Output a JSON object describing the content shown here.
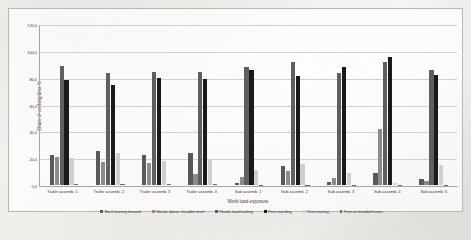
{
  "figure": {
    "caption": ""
  },
  "chart_data": {
    "type": "bar",
    "title": "",
    "xlabel": "Work load exposure",
    "ylabel": "Share of working time %",
    "ylim": [
      0,
      120
    ],
    "ytick_step": 20,
    "ytick_labels": [
      "0,0",
      "20,0",
      "40,0",
      "60,0",
      "80,0",
      "100,0",
      "120,0"
    ],
    "grid": true,
    "legend_position": "bottom",
    "categories": [
      "Trailer assemb. 1",
      "Trailer assemb. 2",
      "Trailer assemb. 3",
      "Trailer assemb. 4",
      "Sub assemb. 1",
      "Sub assemb. 2",
      "Sub assemb. 3",
      "Sub assemb. 4",
      "Sub assemb. 5"
    ],
    "series": [
      {
        "name": "Back leaning forward",
        "color": "#595959",
        "values": [
          22.5,
          25.8,
          22.4,
          23.9,
          1.4,
          14.3,
          2.2,
          8.8,
          4.8
        ]
      },
      {
        "name": "Hands above shoulder level",
        "color": "#8c8c8c",
        "values": [
          21.3,
          17.6,
          16.8,
          8.2,
          5.9,
          10.8,
          5.2,
          42.2,
          2.8
        ]
      },
      {
        "name": "Hands load hauling",
        "color": "#5f5f5f",
        "values": [
          88.9,
          84.3,
          84.8,
          84.6,
          88.2,
          92.6,
          84.3,
          92.2,
          86.4
        ]
      },
      {
        "name": "Feet standing",
        "color": "#1a1a1a",
        "values": [
          78.9,
          75.2,
          80.2,
          79.4,
          86.1,
          81.9,
          88.8,
          95.8,
          82.5
        ]
      },
      {
        "name": "Feet moving",
        "color": "#cfcfcf",
        "values": [
          20.6,
          23.8,
          17.9,
          19.1,
          11.6,
          15.8,
          8.9,
          1.7,
          15.2
        ]
      },
      {
        "name": "Feet on bended knees",
        "color": "#6b6b6b",
        "values": [
          0.5,
          0.6,
          0.6,
          0.5,
          0.2,
          0.2,
          0.2,
          0.2,
          0.2
        ]
      }
    ]
  }
}
